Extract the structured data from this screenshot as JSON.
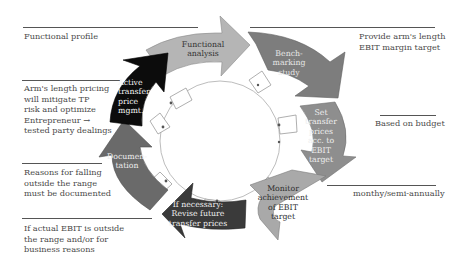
{
  "diagram": {
    "type": "cyclic-process",
    "steps": [
      {
        "label": "Functional\nanalysis",
        "color": "#b5b5b5",
        "text_color": "#333333"
      },
      {
        "label": "Bench-\nmarking\nstudy",
        "color": "#7d7d7d",
        "text_color": "#e6e6e6"
      },
      {
        "label": "Set\ntransfer\nprices\nacc. to\nEBIT\ntarget",
        "color": "#8e8e8e",
        "text_color": "#eeeeee"
      },
      {
        "label": "Monitor\nachievement\nof EBIT\ntarget",
        "color": "#a9a9a9",
        "text_color": "#2e2e2e"
      },
      {
        "label": "If necessary:\nRevise future\ntransfer prices",
        "color": "#3a3a3a",
        "text_color": "#f0f0f0"
      },
      {
        "label": "Documen-\ntation",
        "color": "#6a6a6a",
        "text_color": "#eeeeee"
      },
      {
        "label": "Active\ntransfer\nprice\nmgmt.",
        "color": "#0c0c0c",
        "text_color": "#f4f4f4"
      }
    ],
    "notes_left": [
      {
        "text": "Functional profile"
      },
      {
        "text": "Arm's length pricing\nwill mitigate TP\nrisk and optimize\nEntrepreneur →\ntested party dealings"
      },
      {
        "text": "Reasons for falling\noutside the range\nmust be documented"
      },
      {
        "text": "If actual EBIT is outside\nthe range and/or for\nbusiness reasons"
      }
    ],
    "notes_right": [
      {
        "text": "Provide arm's length\nEBIT margin target"
      },
      {
        "text": "Based on budget"
      },
      {
        "text": "monthy/semi-annually"
      }
    ]
  }
}
